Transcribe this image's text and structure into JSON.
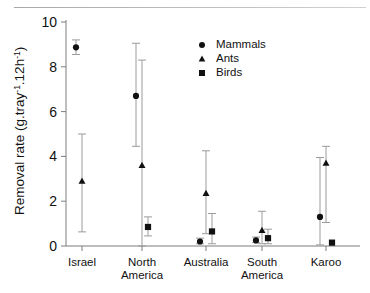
{
  "figure": {
    "background": "#ffffff",
    "axis_color": "#7d7d7d",
    "marker_color": "#111111",
    "errorbar_color": "#9b9b9b"
  },
  "axis": {
    "y_title_main": "Removal rate (g.tray",
    "y_title_sup1": "-1",
    "y_title_mid": ".12h",
    "y_title_sup2": "-1",
    "y_title_end": ")",
    "y_ticks": [
      "0",
      "2",
      "4",
      "6",
      "8",
      "10"
    ],
    "x_labels_line1": [
      "Israel",
      "North",
      "Australia",
      "South",
      "Karoo"
    ],
    "x_labels_line2": [
      "",
      "America",
      "",
      "America",
      ""
    ]
  },
  "legend": {
    "items": [
      {
        "label": "Mammals",
        "marker": "circle-marker"
      },
      {
        "label": "Ants",
        "marker": "triangle-marker"
      },
      {
        "label": "Birds",
        "marker": "square-marker"
      }
    ]
  },
  "chart_data": {
    "type": "scatter",
    "title": "",
    "xlabel": "",
    "ylabel": "Removal rate (g.tray-1.12h-1)",
    "ylim": [
      0,
      10
    ],
    "yticks": [
      0,
      2,
      4,
      6,
      8,
      10
    ],
    "grid": false,
    "legend_position": "top-right",
    "categories": [
      "Israel",
      "North America",
      "Australia",
      "South America",
      "Karoo"
    ],
    "series": [
      {
        "name": "Mammals",
        "marker": "circle",
        "values": [
          8.87,
          6.7,
          0.2,
          0.25,
          1.3
        ],
        "err_low": [
          8.55,
          4.45,
          0.1,
          0.15,
          0.05
        ],
        "err_high": [
          9.2,
          9.05,
          0.35,
          0.4,
          3.95
        ]
      },
      {
        "name": "Ants",
        "marker": "triangle",
        "values": [
          2.9,
          3.6,
          2.35,
          0.7,
          3.7
        ],
        "err_low": [
          0.63,
          0.0,
          0.55,
          0.1,
          1.05
        ],
        "err_high": [
          5.0,
          8.3,
          4.25,
          1.55,
          4.45
        ]
      },
      {
        "name": "Birds",
        "marker": "square",
        "values": [
          null,
          0.85,
          0.65,
          0.35,
          0.15
        ],
        "err_low": [
          null,
          0.45,
          0.1,
          0.1,
          0.15
        ],
        "err_high": [
          null,
          1.3,
          1.45,
          0.75,
          0.15
        ]
      }
    ]
  }
}
